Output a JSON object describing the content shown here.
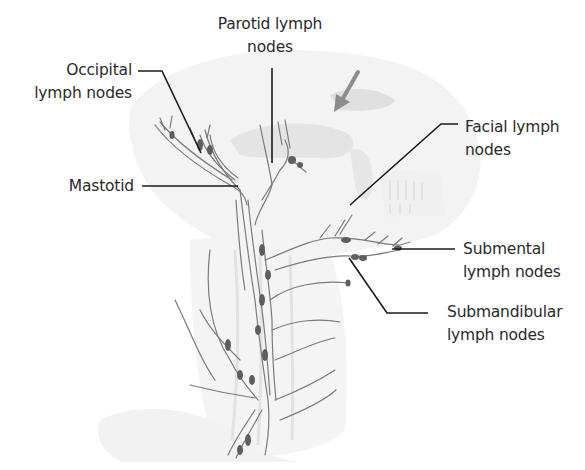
{
  "figure": {
    "colors": {
      "background": "#ffffff",
      "label_text": "#2a2a2a",
      "leader_line": "#1a1a1a",
      "vessel": "#7a7a7a",
      "node": "#5e5e5e",
      "skull_shade": "#ececec",
      "arrow": "#8c8c8c"
    },
    "labels": {
      "occipital": {
        "line1": "Occipital",
        "line2": "lymph nodes"
      },
      "parotid": {
        "line1": "Parotid lymph",
        "line2": "nodes"
      },
      "mastoid": {
        "line1": "Mastotid"
      },
      "facial": {
        "line1": "Facial lymph",
        "line2": "nodes"
      },
      "submental": {
        "line1": "Submental",
        "line2": "lymph nodes"
      },
      "submandibular": {
        "line1": "Submandibular",
        "line2": "lymph nodes"
      }
    },
    "indicator_arrow": {
      "semantic": "arrow-down-left-icon"
    }
  }
}
